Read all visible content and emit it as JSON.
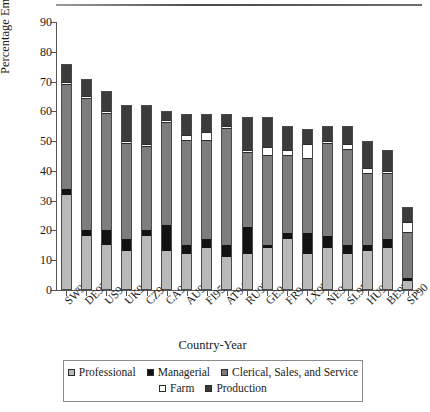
{
  "chart_data": {
    "type": "bar",
    "subtype": "stacked-bar",
    "title": "",
    "xlabel": "Country-Year",
    "ylabel": "Percentage Employed",
    "ylim": [
      0,
      90
    ],
    "ytick_step": 10,
    "yticks": [
      0,
      10,
      20,
      30,
      40,
      50,
      60,
      70,
      80,
      90
    ],
    "grid": false,
    "legend_position": "bottom",
    "categories": [
      "SW95",
      "DE92",
      "US94",
      "UK91",
      "CZ96",
      "CA94",
      "AU94",
      "FI95",
      "AT94",
      "RU95",
      "GE94",
      "FR94",
      "LX97",
      "NE94",
      "SL97",
      "HU94",
      "BE97",
      "SP90"
    ],
    "series": [
      {
        "name": "Professional",
        "color": "#b9b9b9",
        "values": [
          32,
          18,
          15,
          13,
          18,
          13,
          12,
          14,
          11,
          12,
          14,
          17,
          12,
          14,
          12,
          13,
          14,
          3
        ]
      },
      {
        "name": "Managerial",
        "color": "#121212",
        "values": [
          2,
          2,
          5,
          4,
          2,
          9,
          3,
          3,
          4,
          9,
          1,
          2,
          7,
          4,
          3,
          2,
          3,
          1
        ]
      },
      {
        "name": "Clerical, Sales, and Service",
        "color": "#7d7d7d",
        "values": [
          35,
          44,
          39,
          32,
          28,
          34,
          35,
          33,
          39,
          25,
          30,
          26,
          25,
          31,
          32,
          24,
          22,
          15
        ]
      },
      {
        "name": "Farm",
        "color": "#ffffff",
        "values": [
          1,
          1,
          1,
          1,
          1,
          1,
          2,
          3,
          1,
          1,
          3,
          2,
          5,
          1,
          2,
          2,
          1,
          4
        ]
      },
      {
        "name": "Production",
        "color": "#3b3b3b",
        "values": [
          6,
          6,
          7,
          12,
          13,
          3,
          7,
          6,
          4,
          11,
          10,
          8,
          5,
          5,
          6,
          9,
          7,
          5
        ]
      }
    ],
    "totals": [
      76,
      71,
      67,
      62,
      62,
      60,
      59,
      59,
      59,
      58,
      58,
      55,
      54,
      55,
      55,
      50,
      47,
      28
    ]
  },
  "legend": {
    "row1": [
      {
        "label": "Professional",
        "swatch": "sw-professional",
        "icon": "legend-swatch-icon"
      },
      {
        "label": "Managerial",
        "swatch": "sw-managerial",
        "icon": "legend-swatch-icon"
      },
      {
        "label": "Clerical, Sales, and Service",
        "swatch": "sw-clerical",
        "icon": "legend-swatch-icon"
      }
    ],
    "row2": [
      {
        "label": "Farm",
        "swatch": "sw-farm",
        "icon": "legend-swatch-icon"
      },
      {
        "label": "Production",
        "swatch": "sw-production",
        "icon": "legend-swatch-icon"
      }
    ]
  }
}
